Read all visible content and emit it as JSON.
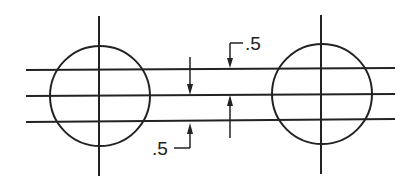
{
  "diagram": {
    "stroke_color": "#222222",
    "background": "#ffffff",
    "circles": [
      {
        "id": "left-circle",
        "cx": 100,
        "cy": 96,
        "r": 50
      },
      {
        "id": "right-circle",
        "cx": 322,
        "cy": 94,
        "r": 50
      }
    ],
    "centerlines_vertical": [
      {
        "id": "left-vertical-centerline",
        "x": 99,
        "y1": 16,
        "y2": 176
      },
      {
        "id": "right-vertical-centerline",
        "x": 321,
        "y1": 15,
        "y2": 174
      }
    ],
    "horizontal_lines": [
      {
        "id": "top-line",
        "x1": 26,
        "y1": 70,
        "x2": 395,
        "y2": 68
      },
      {
        "id": "middle-line",
        "x1": 26,
        "y1": 96,
        "x2": 395,
        "y2": 94
      },
      {
        "id": "bottom-line",
        "x1": 26,
        "y1": 122,
        "x2": 395,
        "y2": 119
      }
    ],
    "dimensions": [
      {
        "id": "lower-left-dimension",
        "label": ".5"
      },
      {
        "id": "upper-right-dimension",
        "label": ".5"
      }
    ]
  }
}
